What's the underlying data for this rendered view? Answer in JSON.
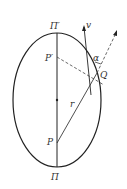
{
  "diagram": {
    "labels": {
      "apoapsis": "Π′",
      "periapsis": "Π",
      "p_prime": "P′",
      "p": "P",
      "q": "Q",
      "velocity": "v",
      "angle": "α",
      "radius": "r"
    },
    "colors": {
      "stroke": "#222222",
      "background": "#ffffff"
    }
  }
}
